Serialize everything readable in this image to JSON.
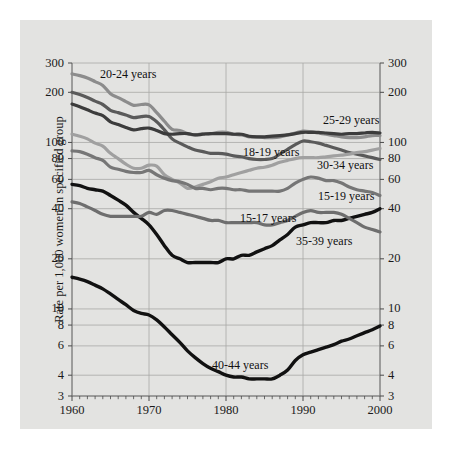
{
  "figure": {
    "background_color": "#ffffff",
    "panel_color": "#e3e3e1",
    "grid_color": "#a8a8a6",
    "text_color": "#1a1a1a"
  },
  "axes": {
    "y_title": "Rate per 1,000 women in specified group",
    "y_ticks": [
      "300",
      "200",
      "100",
      "80",
      "60",
      "40",
      "20",
      "10",
      "8",
      "6",
      "4",
      "3"
    ],
    "y_tick_values": [
      300,
      200,
      100,
      80,
      60,
      40,
      20,
      10,
      8,
      6,
      4,
      3
    ],
    "y_scale": "log",
    "y_min": 3,
    "y_max": 300,
    "x_ticks": [
      "1960",
      "1970",
      "1980",
      "1990",
      "2000"
    ],
    "x_tick_values": [
      1960,
      1970,
      1980,
      1990,
      2000
    ],
    "x_min": 1960,
    "x_max": 2000,
    "x_minor_step": 1
  },
  "series_labels": [
    {
      "text": "20-24 years",
      "x": 100,
      "y": 68
    },
    {
      "text": "25-29 years",
      "x": 323,
      "y": 114
    },
    {
      "text": "18-19 years",
      "x": 243,
      "y": 146
    },
    {
      "text": "30-34 years",
      "x": 317,
      "y": 159
    },
    {
      "text": "15-19 years",
      "x": 318,
      "y": 190
    },
    {
      "text": "15-17 years",
      "x": 240,
      "y": 212
    },
    {
      "text": "35-39 years",
      "x": 296,
      "y": 235
    },
    {
      "text": "40-44 years",
      "x": 212,
      "y": 359
    }
  ],
  "chart_data": {
    "type": "line",
    "title": "",
    "xlabel": "",
    "ylabel": "Rate per 1,000 women in specified group",
    "xlim": [
      1960,
      2000
    ],
    "ylim": [
      3,
      300
    ],
    "yscale": "log",
    "grid": true,
    "legend": "inline-labels",
    "x": [
      1960,
      1961,
      1962,
      1963,
      1964,
      1965,
      1966,
      1967,
      1968,
      1969,
      1970,
      1971,
      1972,
      1973,
      1974,
      1975,
      1976,
      1977,
      1978,
      1979,
      1980,
      1981,
      1982,
      1983,
      1984,
      1985,
      1986,
      1987,
      1988,
      1989,
      1990,
      1991,
      1992,
      1993,
      1994,
      1995,
      1996,
      1997,
      1998,
      1999,
      2000
    ],
    "series": [
      {
        "name": "20-24 years",
        "color": "#8c8c8c",
        "width": 3.2,
        "values": [
          258,
          252,
          244,
          232,
          220,
          196,
          186,
          176,
          167,
          169,
          168,
          151,
          134,
          120,
          118,
          113,
          111,
          113,
          113,
          115,
          115,
          112,
          111,
          108,
          108,
          107,
          107,
          108,
          111,
          114,
          117,
          116,
          114,
          112,
          110,
          108,
          107,
          107,
          108,
          110,
          110
        ]
      },
      {
        "name": "18-19 years",
        "color": "#5a5a5a",
        "width": 3.2,
        "values": [
          200,
          194,
          186,
          177,
          169,
          156,
          151,
          146,
          141,
          143,
          143,
          133,
          119,
          105,
          99,
          94,
          90,
          88,
          86,
          86,
          85,
          83,
          82,
          80,
          79,
          79,
          80,
          85,
          91,
          97,
          102,
          101,
          99,
          96,
          93,
          90,
          87,
          85,
          83,
          81,
          79
        ]
      },
      {
        "name": "25-29 years",
        "color": "#3c3c3c",
        "width": 3.2,
        "values": [
          170,
          164,
          157,
          150,
          145,
          133,
          128,
          123,
          119,
          121,
          122,
          118,
          113,
          112,
          113,
          113,
          111,
          112,
          113,
          113,
          113,
          112,
          112,
          109,
          108,
          108,
          109,
          110,
          111,
          113,
          115,
          115,
          115,
          114,
          113,
          112,
          113,
          113,
          114,
          115,
          114
        ]
      },
      {
        "name": "30-34 years",
        "color": "#a0a0a0",
        "width": 3.2,
        "values": [
          112,
          109,
          105,
          99,
          95,
          86,
          80,
          74,
          70,
          70,
          73,
          72,
          64,
          60,
          57,
          53,
          54,
          56,
          58,
          61,
          62,
          64,
          66,
          68,
          70,
          71,
          73,
          76,
          78,
          80,
          81,
          81,
          81,
          82,
          83,
          84,
          85,
          87,
          88,
          90,
          92
        ]
      },
      {
        "name": "15-19 years",
        "color": "#767676",
        "width": 3.2,
        "values": [
          89,
          88,
          85,
          81,
          78,
          71,
          69,
          67,
          66,
          66,
          68,
          64,
          61,
          59,
          58,
          56,
          53,
          53,
          52,
          53,
          53,
          52,
          52,
          51,
          51,
          51,
          51,
          51,
          53,
          57,
          60,
          62,
          61,
          59,
          59,
          57,
          54,
          52,
          51,
          50,
          48
        ]
      },
      {
        "name": "35-39 years",
        "color": "#111111",
        "width": 3.4,
        "values": [
          56,
          55,
          53,
          52,
          51,
          48,
          45,
          42,
          38,
          35,
          32,
          28,
          24,
          21,
          20,
          19,
          19,
          19,
          19,
          19,
          20,
          20,
          21,
          21,
          22,
          23,
          24,
          26,
          28,
          31,
          32,
          33,
          33,
          33,
          34,
          34,
          35,
          36,
          37,
          38,
          40
        ]
      },
      {
        "name": "15-17 years",
        "color": "#6e6e6e",
        "width": 3.2,
        "values": [
          44,
          43,
          41,
          39,
          37,
          36,
          36,
          36,
          36,
          36,
          38,
          37,
          39,
          39,
          38,
          37,
          36,
          35,
          34,
          34,
          33,
          33,
          33,
          33,
          33,
          32,
          32,
          33,
          34,
          36,
          38,
          39,
          38,
          38,
          38,
          37,
          35,
          33,
          31,
          30,
          29
        ]
      },
      {
        "name": "40-44 years",
        "color": "#111111",
        "width": 3.4,
        "values": [
          15.5,
          15.1,
          14.6,
          13.9,
          13.2,
          12.3,
          11.4,
          10.6,
          9.8,
          9.4,
          9.2,
          8.6,
          7.8,
          7.0,
          6.3,
          5.6,
          5.1,
          4.7,
          4.4,
          4.2,
          4.0,
          3.9,
          3.9,
          3.8,
          3.8,
          3.8,
          3.8,
          4.0,
          4.3,
          4.9,
          5.3,
          5.5,
          5.7,
          5.9,
          6.1,
          6.4,
          6.6,
          6.9,
          7.2,
          7.5,
          7.9
        ]
      }
    ]
  }
}
